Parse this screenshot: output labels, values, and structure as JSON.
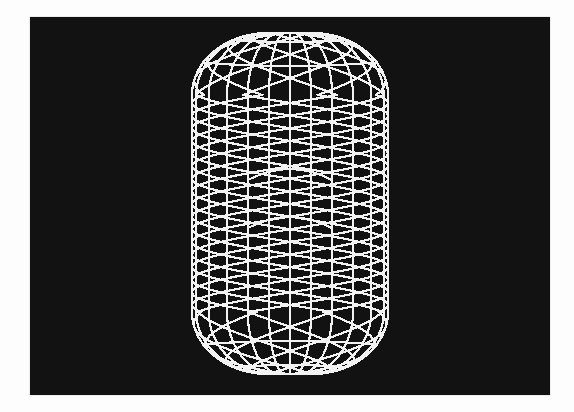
{
  "image": {
    "description": "Wireframe rendering of a 3D capsule (cylinder with rounded caps) drawn in white lines on a black screen",
    "width": 574,
    "height": 412,
    "background_color": "#fdfdfd"
  },
  "screen": {
    "x": 30,
    "y": 17,
    "width": 520,
    "height": 378,
    "color": "#121212"
  },
  "wireframe": {
    "line_color": "#f2f2f2",
    "line_width": 2.2,
    "center_x": 290,
    "radius_x": 98,
    "body_top_y": 95,
    "body_bottom_y": 312,
    "cap_height": 62,
    "top_ring_radius": 22,
    "meridian_angles_deg": [
      -90,
      -73,
      -56,
      -40,
      -25.5,
      -12.4,
      0,
      12.4,
      25.5,
      40,
      56,
      73,
      90
    ],
    "helix": {
      "period_y": 101,
      "phase_offsets_deg": [
        0,
        45,
        90,
        135
      ],
      "x_crossings_y": [
        153,
        204,
        254
      ]
    }
  }
}
